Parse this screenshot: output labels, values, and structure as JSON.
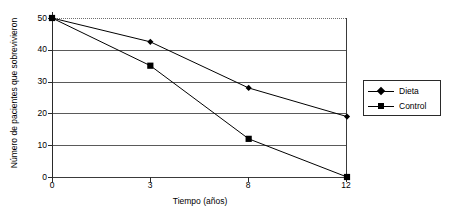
{
  "chart_data": {
    "type": "line",
    "title": "",
    "subtitle": "",
    "xlabel": "Tiempo (años)",
    "ylabel": "Número de pacientes que sobrevivieron",
    "categories": [
      "0",
      "3",
      "8",
      "12"
    ],
    "x": [
      0,
      3,
      8,
      12
    ],
    "xtick_labels": [
      "0",
      "3",
      "8",
      "12"
    ],
    "ytick_labels": [
      "0",
      "10",
      "20",
      "30",
      "40",
      "50"
    ],
    "yticks": [
      0,
      10,
      20,
      30,
      40,
      50
    ],
    "ylim": [
      0,
      50
    ],
    "grid": "horizontal",
    "legend_position": "right",
    "series": [
      {
        "name": "Dieta",
        "marker": "diamond",
        "color": "#000000",
        "values": [
          50,
          42.5,
          28,
          19
        ]
      },
      {
        "name": "Control",
        "marker": "square",
        "color": "#000000",
        "values": [
          50,
          35,
          12,
          0
        ]
      }
    ]
  },
  "legend": {
    "entries": [
      {
        "label": "Dieta",
        "marker": "diamond"
      },
      {
        "label": "Control",
        "marker": "square"
      }
    ]
  },
  "axes": {
    "y_title": "Número de pacientes que sobrevivieron",
    "x_title": "Tiempo (años)",
    "y_ticks": [
      "50",
      "40",
      "30",
      "20",
      "10",
      "0"
    ],
    "x_ticks": [
      "0",
      "3",
      "8",
      "12"
    ]
  },
  "colors": {
    "line": "#000000",
    "grid": "#5a5a5a",
    "axis": "#2a2a2a",
    "background": "#ffffff"
  }
}
